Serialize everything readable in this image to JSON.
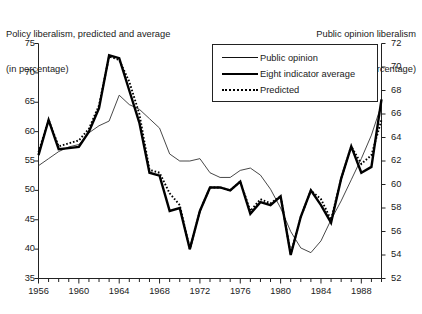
{
  "titles": {
    "left_line1": "Policy liberalism, predicted and average",
    "left_line2": "(in percentage)",
    "right_line1": "Public opinion liberalism",
    "right_line2": "(in percentage)"
  },
  "legend": {
    "items": [
      {
        "label": "Public opinion",
        "style": "thin-solid"
      },
      {
        "label": "Eight indicator average",
        "style": "thick-solid"
      },
      {
        "label": "Predicted",
        "style": "dotted"
      }
    ]
  },
  "chart_data": {
    "type": "line",
    "title": "Policy liberalism, predicted and average",
    "xlabel": "",
    "ylabel": "Policy liberalism, predicted and average (in percentage)",
    "y2label": "Public opinion liberalism (in percentage)",
    "grid": false,
    "legend_position": "top-center",
    "xlim": [
      1956,
      1990
    ],
    "xticks_major": [
      1956,
      1960,
      1964,
      1968,
      1972,
      1976,
      1980,
      1984,
      1988
    ],
    "xticks_minor_step": 1,
    "ylim": [
      35,
      75
    ],
    "yticks": [
      35,
      40,
      45,
      50,
      55,
      60,
      65,
      70,
      75
    ],
    "y2lim": [
      52,
      72
    ],
    "y2ticks": [
      52,
      54,
      56,
      58,
      60,
      62,
      64,
      66,
      68,
      70,
      72
    ],
    "x": [
      1956,
      1957,
      1958,
      1959,
      1960,
      1961,
      1962,
      1963,
      1964,
      1965,
      1966,
      1967,
      1968,
      1969,
      1970,
      1971,
      1972,
      1973,
      1974,
      1975,
      1976,
      1977,
      1978,
      1979,
      1980,
      1981,
      1982,
      1983,
      1984,
      1985,
      1986,
      1987,
      1988,
      1989,
      1990
    ],
    "series": [
      {
        "name": "Public opinion",
        "axis": "right",
        "style": "thin-solid",
        "values": [
          61.6,
          62.2,
          62.8,
          63.2,
          63.4,
          64.4,
          65.0,
          65.4,
          67.6,
          66.8,
          66.4,
          65.6,
          64.8,
          62.6,
          62.0,
          62.0,
          62.2,
          61.0,
          60.6,
          60.6,
          61.2,
          61.4,
          60.8,
          59.6,
          58.0,
          56.0,
          54.6,
          54.2,
          55.2,
          57.0,
          58.6,
          60.4,
          62.2,
          64.2,
          66.8
        ]
      },
      {
        "name": "Eight indicator average",
        "axis": "left",
        "style": "thick-solid",
        "values": [
          56.0,
          62.0,
          57.0,
          57.2,
          57.4,
          60.0,
          64.0,
          73.0,
          72.5,
          67.0,
          61.5,
          53.0,
          52.5,
          46.5,
          47.0,
          40.0,
          46.5,
          50.5,
          50.5,
          50.0,
          51.5,
          46.0,
          48.0,
          47.5,
          49.0,
          39.0,
          45.5,
          50.0,
          47.5,
          44.5,
          52.0,
          57.5,
          53.0,
          54.0,
          65.5
        ]
      },
      {
        "name": "Predicted",
        "axis": "left",
        "style": "dotted",
        "values": [
          56.5,
          62.0,
          57.5,
          58.0,
          58.5,
          60.5,
          64.5,
          72.8,
          72.2,
          68.5,
          63.0,
          53.5,
          53.0,
          49.5,
          47.5,
          40.0,
          46.5,
          50.5,
          50.5,
          50.0,
          51.5,
          46.5,
          48.5,
          47.8,
          49.0,
          39.2,
          45.5,
          50.0,
          48.5,
          45.0,
          52.0,
          57.5,
          54.5,
          56.0,
          62.0
        ]
      }
    ]
  },
  "colors": {
    "ink": "#111111",
    "background": "#ffffff"
  }
}
